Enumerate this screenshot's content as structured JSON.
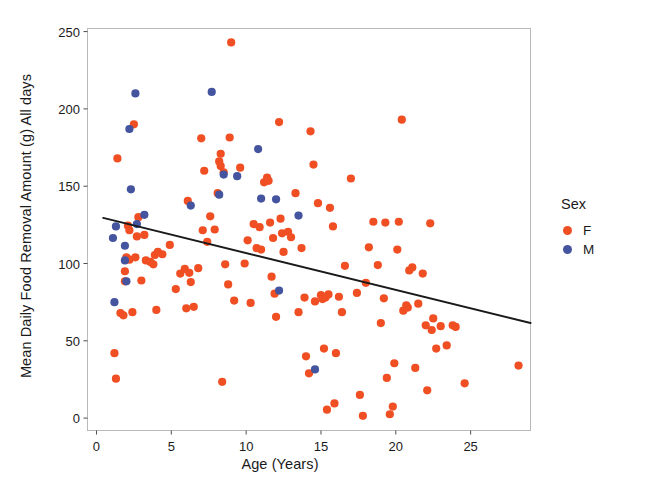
{
  "chart_data": {
    "type": "scatter",
    "title": "",
    "xlabel": "Age (Years)",
    "ylabel": "Mean Daily Food Removal Amount (g) All days",
    "xlim": [
      -0.6,
      29.0
    ],
    "ylim": [
      -8,
      252
    ],
    "xticks": [
      0,
      5,
      10,
      15,
      20,
      25
    ],
    "yticks": [
      0,
      50,
      100,
      150,
      200,
      250
    ],
    "xtick_labels": [
      "0",
      "5",
      "10",
      "15",
      "20",
      "25"
    ],
    "ytick_labels": [
      "0",
      "50",
      "100",
      "150",
      "200",
      "250"
    ],
    "grid": false,
    "legend": {
      "title": "Sex",
      "position": "right",
      "entries": [
        {
          "label": "F",
          "color": "#F04E23",
          "marker": "circle"
        },
        {
          "label": "M",
          "color": "#44549E",
          "marker": "circle"
        }
      ]
    },
    "point_radius": 4.1,
    "trendline": {
      "type": "linear",
      "color": "#1a1a1a",
      "width": 2.0,
      "x_start": 0.45,
      "y_start": 129.5,
      "x_end": 29.0,
      "y_end": 61.5
    },
    "series": [
      {
        "name": "F",
        "color": "#F04E23",
        "points": [
          [
            1.2,
            42.0
          ],
          [
            1.3,
            25.5
          ],
          [
            1.4,
            168.0
          ],
          [
            1.6,
            68.0
          ],
          [
            1.8,
            66.5
          ],
          [
            1.9,
            95.0
          ],
          [
            1.9,
            88.5
          ],
          [
            2.0,
            104.0
          ],
          [
            2.1,
            124.5
          ],
          [
            2.2,
            121.5
          ],
          [
            2.2,
            102.5
          ],
          [
            2.4,
            68.5
          ],
          [
            2.5,
            190.0
          ],
          [
            2.6,
            104.0
          ],
          [
            2.7,
            117.5
          ],
          [
            2.8,
            130.0
          ],
          [
            3.0,
            89.0
          ],
          [
            3.2,
            118.5
          ],
          [
            3.3,
            102.0
          ],
          [
            3.6,
            101.0
          ],
          [
            3.8,
            99.5
          ],
          [
            3.9,
            105.5
          ],
          [
            4.0,
            70.0
          ],
          [
            4.1,
            107.5
          ],
          [
            4.4,
            106.0
          ],
          [
            4.9,
            112.0
          ],
          [
            5.3,
            83.5
          ],
          [
            5.6,
            93.5
          ],
          [
            5.9,
            96.5
          ],
          [
            6.0,
            71.0
          ],
          [
            6.1,
            140.5
          ],
          [
            6.2,
            94.0
          ],
          [
            6.3,
            88.0
          ],
          [
            6.5,
            72.0
          ],
          [
            6.8,
            97.0
          ],
          [
            7.0,
            181.0
          ],
          [
            7.1,
            121.5
          ],
          [
            7.2,
            160.0
          ],
          [
            7.4,
            114.0
          ],
          [
            7.6,
            130.5
          ],
          [
            7.9,
            122.0
          ],
          [
            8.1,
            145.5
          ],
          [
            8.2,
            166.0
          ],
          [
            8.3,
            163.0
          ],
          [
            8.3,
            171.0
          ],
          [
            8.4,
            23.5
          ],
          [
            8.5,
            159.0
          ],
          [
            8.6,
            99.5
          ],
          [
            8.8,
            86.5
          ],
          [
            8.9,
            181.5
          ],
          [
            9.0,
            243.0
          ],
          [
            9.2,
            76.0
          ],
          [
            9.6,
            162.0
          ],
          [
            9.9,
            100.0
          ],
          [
            10.1,
            115.0
          ],
          [
            10.3,
            74.5
          ],
          [
            10.5,
            125.5
          ],
          [
            10.7,
            110.0
          ],
          [
            10.9,
            123.5
          ],
          [
            11.0,
            109.0
          ],
          [
            11.2,
            152.5
          ],
          [
            11.4,
            155.5
          ],
          [
            11.5,
            153.5
          ],
          [
            11.6,
            126.5
          ],
          [
            11.7,
            91.5
          ],
          [
            11.8,
            116.5
          ],
          [
            11.9,
            80.5
          ],
          [
            12.0,
            65.5
          ],
          [
            12.2,
            191.5
          ],
          [
            12.3,
            129.0
          ],
          [
            12.4,
            119.5
          ],
          [
            12.5,
            107.5
          ],
          [
            12.8,
            120.5
          ],
          [
            13.0,
            117.0
          ],
          [
            13.3,
            145.5
          ],
          [
            13.5,
            68.5
          ],
          [
            13.7,
            110.0
          ],
          [
            13.9,
            78.0
          ],
          [
            14.0,
            40.0
          ],
          [
            14.2,
            29.0
          ],
          [
            14.3,
            185.5
          ],
          [
            14.5,
            164.0
          ],
          [
            14.6,
            75.5
          ],
          [
            14.8,
            139.0
          ],
          [
            15.0,
            79.5
          ],
          [
            15.1,
            77.0
          ],
          [
            15.2,
            45.0
          ],
          [
            15.3,
            78.0
          ],
          [
            15.4,
            5.5
          ],
          [
            15.5,
            80.0
          ],
          [
            15.6,
            136.0
          ],
          [
            15.8,
            124.0
          ],
          [
            15.9,
            9.5
          ],
          [
            16.0,
            42.0
          ],
          [
            16.2,
            78.5
          ],
          [
            16.4,
            68.5
          ],
          [
            16.6,
            98.5
          ],
          [
            17.0,
            155.0
          ],
          [
            17.4,
            81.0
          ],
          [
            17.6,
            15.0
          ],
          [
            17.8,
            1.5
          ],
          [
            18.0,
            87.5
          ],
          [
            18.2,
            110.5
          ],
          [
            18.5,
            127.0
          ],
          [
            18.8,
            99.0
          ],
          [
            19.0,
            61.5
          ],
          [
            19.2,
            77.5
          ],
          [
            19.3,
            126.5
          ],
          [
            19.4,
            26.0
          ],
          [
            19.6,
            2.5
          ],
          [
            19.8,
            7.5
          ],
          [
            19.9,
            35.5
          ],
          [
            20.1,
            109.0
          ],
          [
            20.2,
            127.0
          ],
          [
            20.4,
            193.0
          ],
          [
            20.5,
            69.5
          ],
          [
            20.7,
            73.0
          ],
          [
            20.8,
            71.5
          ],
          [
            20.9,
            95.5
          ],
          [
            21.1,
            97.5
          ],
          [
            21.3,
            32.5
          ],
          [
            21.5,
            74.0
          ],
          [
            21.8,
            93.5
          ],
          [
            22.0,
            60.0
          ],
          [
            22.1,
            18.0
          ],
          [
            22.3,
            126.0
          ],
          [
            22.4,
            57.0
          ],
          [
            22.5,
            64.5
          ],
          [
            22.7,
            45.0
          ],
          [
            23.0,
            59.5
          ],
          [
            23.4,
            47.0
          ],
          [
            23.8,
            60.0
          ],
          [
            24.0,
            59.0
          ],
          [
            24.6,
            22.5
          ],
          [
            28.2,
            34.0
          ]
        ]
      },
      {
        "name": "M",
        "color": "#44549E",
        "points": [
          [
            1.1,
            116.5
          ],
          [
            1.2,
            75.0
          ],
          [
            1.3,
            124.0
          ],
          [
            1.9,
            111.5
          ],
          [
            1.9,
            102.0
          ],
          [
            2.0,
            88.5
          ],
          [
            2.2,
            187.0
          ],
          [
            2.3,
            148.0
          ],
          [
            2.6,
            210.0
          ],
          [
            2.7,
            125.5
          ],
          [
            3.2,
            131.5
          ],
          [
            6.3,
            137.5
          ],
          [
            7.7,
            211.0
          ],
          [
            8.2,
            144.5
          ],
          [
            8.5,
            157.5
          ],
          [
            9.4,
            156.5
          ],
          [
            10.8,
            174.0
          ],
          [
            11.0,
            142.0
          ],
          [
            12.0,
            141.5
          ],
          [
            12.2,
            82.5
          ],
          [
            13.5,
            131.0
          ],
          [
            14.6,
            31.5
          ]
        ]
      }
    ]
  }
}
